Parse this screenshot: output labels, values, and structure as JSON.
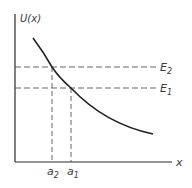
{
  "diagram": {
    "y_axis_label": "U(x)",
    "x_axis_label": "x",
    "levels": [
      {
        "label": "E",
        "sub": "2",
        "y": 67
      },
      {
        "label": "E",
        "sub": "1",
        "y": 88
      }
    ],
    "points": [
      {
        "label": "a",
        "sub": "2",
        "x": 52
      },
      {
        "label": "a",
        "sub": "1",
        "x": 71
      }
    ],
    "colors": {
      "line": "#2a2a2a",
      "dash": "#555555",
      "text": "#3a3a3a"
    }
  }
}
